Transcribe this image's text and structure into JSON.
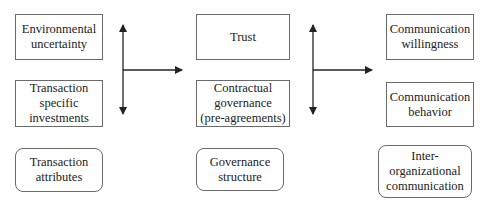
{
  "diagram": {
    "columns": [
      {
        "boxes": [
          {
            "label": "Environmental\nuncertainty"
          },
          {
            "label": "Transaction\nspecific\ninvestments"
          }
        ],
        "category": {
          "label": "Transaction\nattributes"
        }
      },
      {
        "boxes": [
          {
            "label": "Trust"
          },
          {
            "label": "Contractual\ngovernance\n(pre-agreements)"
          }
        ],
        "category": {
          "label": "Governance\nstructure"
        }
      },
      {
        "boxes": [
          {
            "label": "Communication\nwillingness"
          },
          {
            "label": "Communication\nbehavior"
          }
        ],
        "category": {
          "label": "Inter-\norganizational\ncommunication"
        }
      }
    ],
    "connectors": [
      {
        "from": "column-1",
        "to": "column-2",
        "type": "bidirectional-vertical-with-right-arrow"
      },
      {
        "from": "column-2",
        "to": "column-3",
        "type": "bidirectional-vertical-with-right-arrow"
      }
    ],
    "colors": {
      "line": "#222222",
      "border": "#6a6a6a"
    }
  }
}
